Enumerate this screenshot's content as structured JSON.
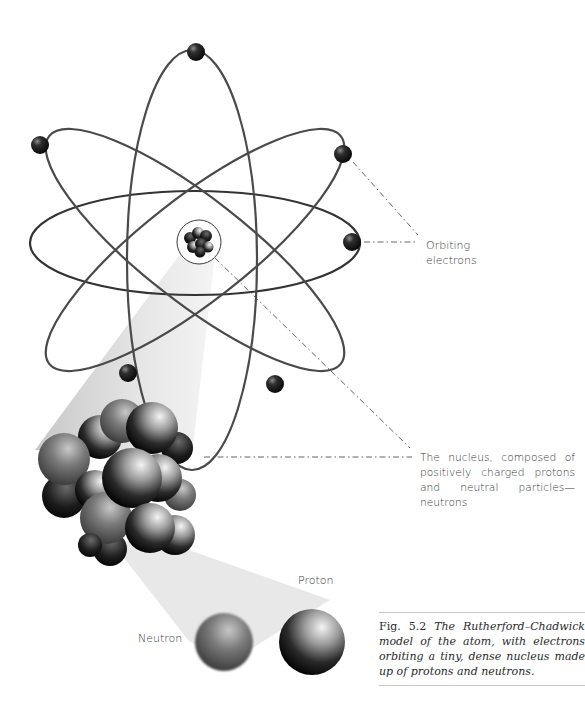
{
  "figure": {
    "title": "Rutherford–Chadwick model of the atom",
    "labels": {
      "orbiting_electrons_line1": "Orbiting",
      "orbiting_electrons_line2": "electrons",
      "nucleus": "The nucleus, composed of positively charged protons and neutral particles—neutrons",
      "proton": "Proton",
      "neutron": "Neutron"
    },
    "caption": {
      "number": "Fig. 5.2",
      "text": "The Rutherford–Chadwick model of the atom, with electrons orbiting a tiny, dense nucleus made up of protons and neutrons."
    },
    "colors": {
      "orbit": "#4a4a4a",
      "electron": "#1e1e1e",
      "beam": "#d9d9d9",
      "leader_line": "#555555",
      "text": "#3a3a3a"
    },
    "counts": {
      "orbits": 4,
      "electrons": 7
    }
  }
}
